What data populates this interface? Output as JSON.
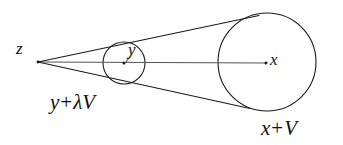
{
  "figure": {
    "name": "cone-tangent-spheres-diagram",
    "background_color": "#ffffff",
    "stroke_color": "#1a1a1a",
    "width": 343,
    "height": 145,
    "labels": {
      "apex": "z",
      "small_circle_center": "y",
      "large_circle_center": "x",
      "small_sphere_caption_var": "y",
      "small_sphere_caption_op": "+",
      "small_sphere_caption_scalar": "λ",
      "small_sphere_caption_vector": "V",
      "large_sphere_caption_var": "x",
      "large_sphere_caption_op": "+",
      "large_sphere_caption_vector": "V"
    },
    "geometry": {
      "apex_point": [
        38,
        62
      ],
      "small_circle": {
        "cx": 124,
        "cy": 63,
        "r": 21
      },
      "large_circle": {
        "cx": 267,
        "cy": 62,
        "r": 49
      },
      "axis_line": [
        [
          38,
          62
        ],
        [
          266,
          63
        ]
      ],
      "upper_tangent": [
        [
          38,
          62
        ],
        [
          258,
          16
        ]
      ],
      "lower_tangent": [
        [
          38,
          62
        ],
        [
          249,
          108
        ]
      ],
      "center_dot_small": [
        124,
        63
      ],
      "center_dot_large": [
        266,
        63
      ]
    }
  }
}
